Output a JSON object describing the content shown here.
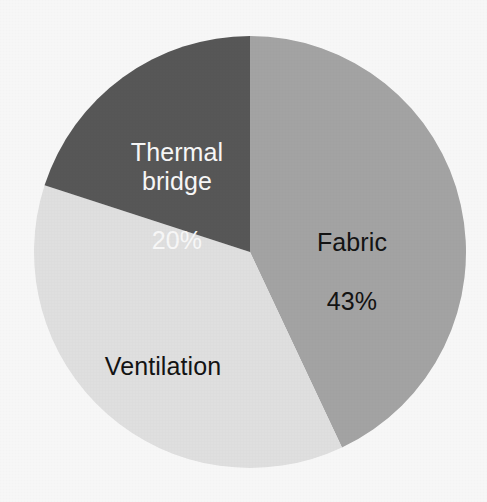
{
  "chart_data": {
    "type": "pie",
    "title": "",
    "subtitle": "",
    "xlabel": "",
    "ylabel": "",
    "legend_position": "none",
    "grid": false,
    "labels_inside_slices": true,
    "start_angle_deg": 0,
    "direction": "clockwise",
    "background_color": "#ffffff",
    "categories": [
      "Fabric",
      "Ventilation",
      "Thermal bridge"
    ],
    "values": [
      43,
      37,
      20
    ],
    "units": "%",
    "slices": [
      {
        "name": "Fabric",
        "value": 43,
        "value_text": "43%",
        "value_shown": true,
        "color": "#a8a8a8",
        "text_color": "#141414",
        "start_angle_deg": 0,
        "end_angle_deg": 154.8
      },
      {
        "name": "Ventilation",
        "value": 37,
        "value_text": "37%",
        "value_shown": false,
        "color": "#e6e6e6",
        "text_color": "#141414",
        "start_angle_deg": 154.8,
        "end_angle_deg": 288.0
      },
      {
        "name": "Thermal bridge",
        "value": 20,
        "value_text": "20%",
        "value_shown": true,
        "color": "#5a5a5a",
        "text_color": "#ffffff",
        "start_angle_deg": 288.0,
        "end_angle_deg": 360.0
      }
    ]
  },
  "labels": {
    "fabric": {
      "name": "Fabric",
      "value_text": "43%"
    },
    "ventilation": {
      "name": "Ventilation",
      "value_text": ""
    },
    "thermal_bridge": {
      "name": "Thermal bridge",
      "value_text": "20%"
    }
  },
  "geometry": {
    "center_x": 250,
    "center_y": 252,
    "radius": 216
  }
}
